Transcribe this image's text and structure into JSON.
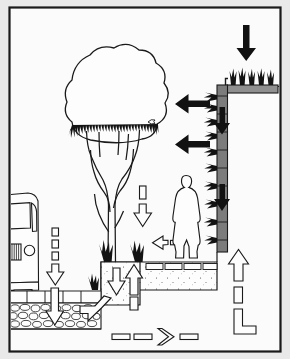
{
  "figure": {
    "type": "architectural-section-diagram",
    "orientation": "portrait",
    "frame": {
      "border_color": "#1a1a1a",
      "page_background": "#e9e9e9",
      "drawing_background": "#fbfbfb"
    },
    "palette": {
      "line": "#1a1a1a",
      "solid_arrow": "#111111",
      "outline_arrow_fill": "#ffffff",
      "wall_panel": "#7a7a7a",
      "roof_substrate": "#8a8a8a",
      "vegetation": "#111111",
      "gravel": "#ffffff",
      "soil_fill": "#fdfdfd"
    }
  },
  "elements": {
    "green_roof": {
      "name": "Green roof",
      "grass_tufts": 4,
      "substrate_label": "growing medium slab"
    },
    "green_wall": {
      "name": "Green wall / living facade",
      "plant_rows": 9,
      "panel_label": "vertical planting panel"
    },
    "tree": {
      "name": "Mature tree",
      "canopy_label": "canopy",
      "trunk_label": "forked trunk"
    },
    "shrubs": {
      "name": "Shrub planting",
      "count": 3
    },
    "person": {
      "name": "Human figure for scale"
    },
    "vehicle": {
      "name": "Parked vehicle / bus"
    },
    "paving": {
      "name": "Permeable paving",
      "paver_count": 5
    },
    "gravel_base": {
      "name": "Gravel sub-base / storage layer"
    },
    "soil_fill": {
      "name": "Planting soil / structural fill"
    },
    "terrace": {
      "name": "Raised terrace deck"
    }
  },
  "arrows": [
    {
      "id": "a1",
      "name": "rain-onto-green-roof",
      "style": "solid",
      "direction": "down",
      "meaning": "Rainfall onto green roof"
    },
    {
      "id": "a2",
      "name": "wall-airflow-upper",
      "style": "solid",
      "direction": "left",
      "meaning": "Air cooling from green wall"
    },
    {
      "id": "a3",
      "name": "wall-airflow-lower",
      "style": "solid",
      "direction": "left",
      "meaning": "Air cooling from green wall"
    },
    {
      "id": "a4",
      "name": "wall-runoff-upper",
      "style": "solid",
      "direction": "down",
      "meaning": "Water travelling down wall"
    },
    {
      "id": "a5",
      "name": "wall-runoff-lower",
      "style": "solid",
      "direction": "down",
      "meaning": "Water travelling down wall"
    },
    {
      "id": "a6",
      "name": "rain-through-canopy",
      "style": "dashed",
      "direction": "down",
      "meaning": "Rainfall through tree canopy"
    },
    {
      "id": "a7",
      "name": "shrub-airflow",
      "style": "dashed",
      "direction": "left",
      "meaning": "Evapotranspiration breeze"
    },
    {
      "id": "a8",
      "name": "rain-onto-paving",
      "style": "dashed",
      "direction": "down",
      "meaning": "Rainfall onto permeable paving"
    },
    {
      "id": "a9",
      "name": "infiltration-through-paving",
      "style": "outline",
      "direction": "down",
      "meaning": "Infiltration through paving"
    },
    {
      "id": "a10",
      "name": "runoff-into-gravel",
      "style": "outline",
      "direction": "left",
      "meaning": "Runoff entering gravel store"
    },
    {
      "id": "a11",
      "name": "infiltration-into-soil",
      "style": "outline",
      "direction": "down",
      "meaning": "Infiltration into soil"
    },
    {
      "id": "a12",
      "name": "capillary-rise",
      "style": "outline",
      "direction": "up",
      "meaning": "Capillary rise / uptake"
    },
    {
      "id": "a13",
      "name": "subsurface-flow",
      "style": "dashed",
      "direction": "right",
      "meaning": "Subsurface conveyance"
    },
    {
      "id": "a14",
      "name": "discharge-riser",
      "style": "dashed",
      "direction": "up",
      "meaning": "Discharge / recycled supply"
    }
  ]
}
